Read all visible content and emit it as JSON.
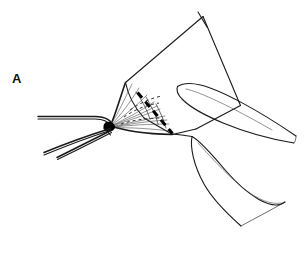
{
  "figure": {
    "panel_label": "A",
    "caption": "",
    "background_color": "#ffffff",
    "ink_color": "#1a1a1a",
    "width": 305,
    "height": 253,
    "style": "black-and-white line drawing"
  },
  "elements": {
    "panel_label_text": "A",
    "flap_name": "tissue-flap",
    "dashed_incision_name": "dashed-incision-line",
    "left_instrument_name": "left-forceps",
    "upper_instrument_name": "upper-forceps-arm",
    "lower_instrument_name": "lower-forceps-arm",
    "fan_lines_name": "suture-fan-lines"
  }
}
